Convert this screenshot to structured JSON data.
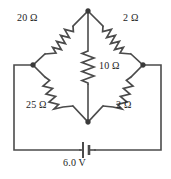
{
  "figure": {
    "background_color": "#ffffff",
    "line_color": "#4b4b4b",
    "text_color": "#1d1d1d"
  },
  "components": {
    "resistor_top_left": {
      "label": "20 Ω",
      "value": 20,
      "unit": "Ω",
      "orientation": "diagonal",
      "position": "top-left-branch"
    },
    "resistor_top_right": {
      "label": "2 Ω",
      "value": 2,
      "unit": "Ω",
      "orientation": "diagonal",
      "position": "top-right-branch"
    },
    "resistor_center": {
      "label": "10 Ω",
      "value": 10,
      "unit": "Ω",
      "orientation": "vertical",
      "position": "bridge-branch"
    },
    "resistor_bottom_left": {
      "label": "25 Ω",
      "value": 25,
      "unit": "Ω",
      "orientation": "diagonal",
      "position": "bottom-left-branch"
    },
    "resistor_bottom_right": {
      "label": "2 Ω",
      "value": 2,
      "unit": "Ω",
      "orientation": "diagonal",
      "position": "bottom-right-branch"
    },
    "battery": {
      "label": "6.0 V",
      "value": 6.0,
      "unit": "V",
      "orientation": "horizontal",
      "position": "bottom-rail"
    }
  },
  "nodes": {
    "top": {
      "name": "top-node",
      "x": 88,
      "y": 11
    },
    "left": {
      "name": "left-node",
      "x": 33,
      "y": 65
    },
    "right": {
      "name": "right-node",
      "x": 143,
      "y": 65
    },
    "bottom": {
      "name": "bottom-node",
      "x": 88,
      "y": 122
    }
  }
}
